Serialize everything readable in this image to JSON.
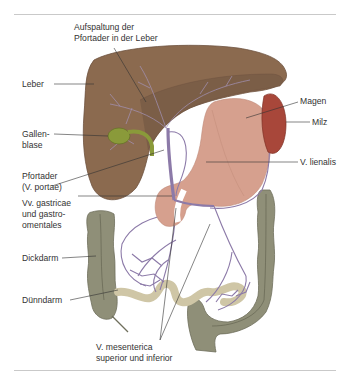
{
  "figure": {
    "labels": {
      "aufspaltung": {
        "line1": "Aufspaltung der",
        "line2": "Pfortader in der Leber"
      },
      "leber": {
        "line1": "Leber"
      },
      "gallenblase": {
        "line1": "Gallen-",
        "line2": "blase"
      },
      "pfortader": {
        "line1": "Pfortader",
        "line2": "(V. portae)"
      },
      "vv_gastricae": {
        "line1": "Vv. gastricae",
        "line2": "und gastro-",
        "line3": "omentales"
      },
      "dickdarm": {
        "line1": "Dickdarm"
      },
      "duenndarm": {
        "line1": "Dünndarm"
      },
      "v_mesenterica": {
        "line1": "V. mesenterica",
        "line2": "superior und inferior"
      },
      "magen": {
        "line1": "Magen"
      },
      "milz": {
        "line1": "Milz"
      },
      "v_lienalis": {
        "line1": "V. lienalis"
      }
    },
    "colors": {
      "liver": "#8b6a4f",
      "liver_dark": "#6e5340",
      "gallbladder": "#8a9a3a",
      "stomach": "#d6a08e",
      "spleen": "#a8473a",
      "vein": "#8c7aa8",
      "colon": "#8c8c76",
      "small_intestine": "#cfc6a6",
      "leader_line": "#333333",
      "rule": "#c9c9c9"
    }
  }
}
